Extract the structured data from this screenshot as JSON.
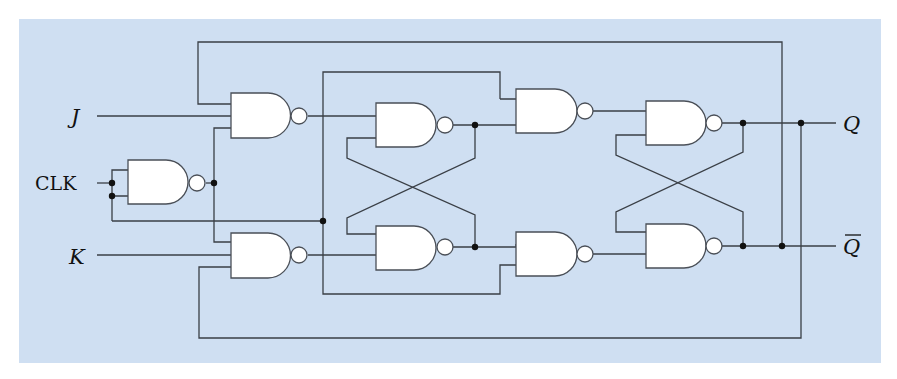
{
  "diagram": {
    "colors": {
      "background": "#cfdff2",
      "wire": "#3a3f46",
      "gate_fill": "#ffffff",
      "junction": "#111111"
    },
    "labels": {
      "j": "J",
      "clk": "CLK",
      "k": "K",
      "q": "Q",
      "q_bar": "Q"
    },
    "gates": [
      {
        "id": "clk-inverter",
        "type": "NAND",
        "inputs": 2
      },
      {
        "id": "j-input-gate",
        "type": "NAND",
        "inputs": 3
      },
      {
        "id": "k-input-gate",
        "type": "NAND",
        "inputs": 3
      },
      {
        "id": "master-latch-top",
        "type": "NAND",
        "inputs": 2
      },
      {
        "id": "master-latch-bottom",
        "type": "NAND",
        "inputs": 2
      },
      {
        "id": "slave-input-top",
        "type": "NAND",
        "inputs": 2
      },
      {
        "id": "slave-input-bottom",
        "type": "NAND",
        "inputs": 2
      },
      {
        "id": "slave-latch-top",
        "type": "NAND",
        "inputs": 2
      },
      {
        "id": "slave-latch-bottom",
        "type": "NAND",
        "inputs": 2
      }
    ]
  }
}
